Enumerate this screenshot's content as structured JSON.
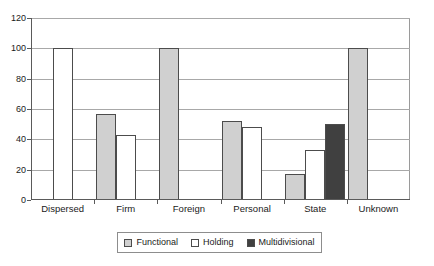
{
  "chart_data": {
    "type": "bar",
    "title": "",
    "xlabel": "",
    "ylabel": "",
    "ylim": [
      0,
      120
    ],
    "yticks": [
      0,
      20,
      40,
      60,
      80,
      100,
      120
    ],
    "grid": true,
    "legend_position": "bottom",
    "categories": [
      "Dispersed",
      "Firm",
      "Foreign",
      "Personal",
      "State",
      "Unknown"
    ],
    "series": [
      {
        "name": "Functional",
        "color": "#d0d0d0",
        "values": [
          0,
          57,
          100,
          52,
          17,
          100
        ]
      },
      {
        "name": "Holding",
        "color": "#ffffff",
        "values": [
          100,
          43,
          0,
          48,
          33,
          0
        ]
      },
      {
        "name": "Multidivisional",
        "color": "#404040",
        "values": [
          0,
          0,
          0,
          0,
          50,
          0
        ]
      }
    ]
  },
  "axis": {
    "y_tick_labels": [
      "0",
      "20",
      "40",
      "60",
      "80",
      "100",
      "120"
    ],
    "x_tick_labels": [
      "Dispersed",
      "Firm",
      "Foreign",
      "Personal",
      "State",
      "Unknown"
    ]
  },
  "legend": {
    "entries": [
      {
        "label": "Functional",
        "color": "#d0d0d0"
      },
      {
        "label": "Holding",
        "color": "#ffffff"
      },
      {
        "label": "Multidivisional",
        "color": "#404040"
      }
    ]
  },
  "title_remnant": {
    "text": ""
  },
  "colors": {
    "functional": "#d0d0d0",
    "holding": "#ffffff",
    "multidivisional": "#404040",
    "bar_border": "#4c4c4c",
    "gridline": "#a8a8a8",
    "axis": "#5a5a5a",
    "frame": "#9a9a9a",
    "text": "#1a1a1a",
    "background": "#ffffff"
  }
}
